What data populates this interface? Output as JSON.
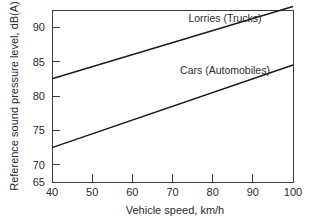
{
  "chart_data": {
    "type": "line",
    "title": "",
    "xlabel": "Vehicle speed, km/h",
    "ylabel": "Reference sound pressure level, dB(A)",
    "xlim": [
      40,
      100
    ],
    "ylim": [
      65,
      90
    ],
    "xticks": [
      40,
      50,
      60,
      70,
      80,
      90,
      100
    ],
    "yticks": [
      65,
      70,
      75,
      80,
      85,
      90
    ],
    "xtick_labels": [
      "40",
      "50",
      "60",
      "70",
      "80",
      "90",
      "100"
    ],
    "ytick_labels": [
      "65",
      "70",
      "75",
      "80",
      "85",
      "90"
    ],
    "grid": false,
    "legend": "inline-annotations",
    "x": [
      40,
      100
    ],
    "series": [
      {
        "name": "Lorries (Trucks)",
        "values": [
          80.0,
          90.5
        ],
        "label_x": 74,
        "label_y": 89.2
      },
      {
        "name": "Cars (Automobiles)",
        "values": [
          70.0,
          82.0
        ],
        "label_x": 74,
        "label_y": 81.5
      }
    ],
    "line_color": "#1a1a1a",
    "axis_color": "#3a3a3a",
    "background": "#ffffff"
  },
  "axes": {
    "x_axis_title": "Vehicle speed, km/h",
    "y_axis_title": "Reference sound pressure level, dB(A)"
  },
  "ticks": {
    "y": {
      "t90": "90",
      "t85": "85",
      "t80": "80",
      "t75": "75",
      "t70": "70",
      "t65": "65"
    },
    "x": {
      "t40": "40",
      "t50": "50",
      "t60": "60",
      "t70": "70",
      "t80": "80",
      "t90": "90",
      "t100": "100"
    }
  },
  "annotations": {
    "lorries": "Lorries (Trucks)",
    "cars": "Cars (Automobiles)"
  }
}
